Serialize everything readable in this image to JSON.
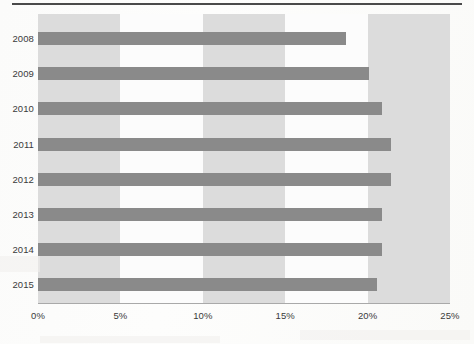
{
  "chart_data": {
    "type": "bar",
    "orientation": "horizontal",
    "title": "",
    "subtitle": "",
    "xlabel": "",
    "ylabel": "",
    "categories": [
      "2008",
      "2009",
      "2010",
      "2011",
      "2012",
      "2013",
      "2014",
      "2015"
    ],
    "values": [
      18.7,
      20.1,
      20.9,
      21.4,
      21.4,
      20.9,
      20.9,
      20.6
    ],
    "value_unit": "%",
    "xlim": [
      0,
      25
    ],
    "xticks": [
      0,
      5,
      10,
      15,
      20,
      25
    ],
    "xtick_labels": [
      "0%",
      "5%",
      "10%",
      "15%",
      "20%",
      "25%"
    ],
    "grid": false,
    "banding": "alternating 5% vertical bands",
    "legend": null,
    "legend_position": "none",
    "series": [
      {
        "name": "",
        "values": [
          18.7,
          20.1,
          20.9,
          21.4,
          21.4,
          20.9,
          20.9,
          20.6
        ]
      }
    ]
  },
  "colors": {
    "bar": "#8a8a8a",
    "band_shaded": "#dcdcdc",
    "band_plain": "#fcfcfc",
    "axis": "#a9a9a9",
    "top_rule": "#4a4a4a",
    "text": "#3a3a3a",
    "page": "#fdfdfd"
  },
  "axis": {
    "x_ticks": [
      "0%",
      "5%",
      "10%",
      "15%",
      "20%",
      "25%"
    ],
    "y_ticks": [
      "2008",
      "2009",
      "2010",
      "2011",
      "2012",
      "2013",
      "2014",
      "2015"
    ]
  }
}
